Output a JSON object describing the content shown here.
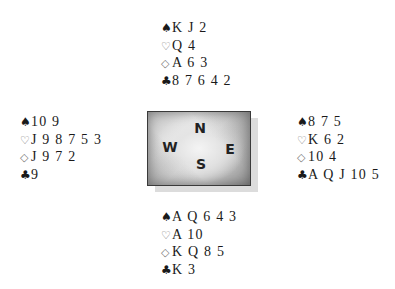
{
  "suit_symbols": {
    "spade": "♠",
    "heart": "♡",
    "diamond": "◇",
    "club": "♣"
  },
  "compass": {
    "north": "N",
    "west": "W",
    "east": "E",
    "south": "S"
  },
  "hands": {
    "north": {
      "spades": "K J 2",
      "hearts": "Q 4",
      "diamonds": "A 6 3",
      "clubs": "8 7 6 4 2"
    },
    "west": {
      "spades": "10 9",
      "hearts": "J 9 8 7 5 3",
      "diamonds": "J 9 7 2",
      "clubs": "9"
    },
    "east": {
      "spades": "8 7 5",
      "hearts": "K 6 2",
      "diamonds": "10 4",
      "clubs": "A Q J 10 5"
    },
    "south": {
      "spades": "A Q 6 4 3",
      "hearts": "A 10",
      "diamonds": "K Q 8 5",
      "clubs": "K 3"
    }
  }
}
